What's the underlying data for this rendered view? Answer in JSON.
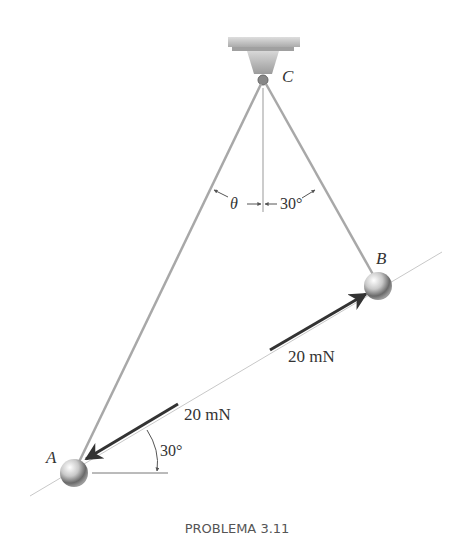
{
  "figure": {
    "support_label": "C",
    "ball_a_label": "A",
    "ball_b_label": "B",
    "angle_theta_label": "θ",
    "angle_bc_label": "30°",
    "angle_force_label": "30°",
    "force_at_b_label": "20 mN",
    "force_at_a_label": "20 mN",
    "caption": "PROBLEMA 3.11"
  },
  "colors": {
    "strings": "#a8a8a8",
    "force_arrow": "#333333",
    "line_of_action": "#c8c8c8",
    "ball_light": "#f4f4f4",
    "ball_dark": "#555555",
    "support": "#b5b5b5"
  }
}
